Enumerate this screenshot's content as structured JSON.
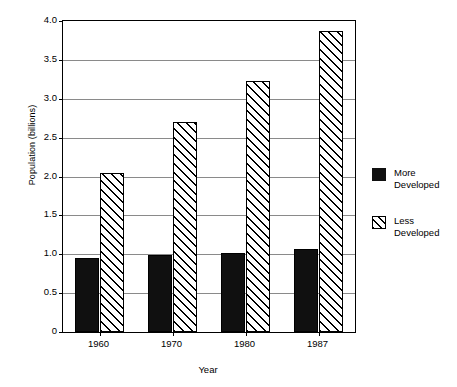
{
  "chart_data": {
    "type": "bar",
    "title": "",
    "xlabel": "Year",
    "ylabel": "Population (billions)",
    "categories": [
      "1960",
      "1970",
      "1980",
      "1987"
    ],
    "series": [
      {
        "name": "More Developed",
        "values": [
          0.95,
          0.99,
          1.02,
          1.07
        ],
        "style": "solid-black"
      },
      {
        "name": "Less Developed",
        "values": [
          2.05,
          2.7,
          3.23,
          3.87
        ],
        "style": "hatched-diagonal"
      }
    ],
    "ylim": [
      0,
      4.0
    ],
    "ytick_labels": [
      "0",
      "0.5",
      "1.0",
      "1.5",
      "2.0",
      "2.5",
      "3.0",
      "3.5",
      "4.0"
    ],
    "ytick_values": [
      0,
      0.5,
      1.0,
      1.5,
      2.0,
      2.5,
      3.0,
      3.5,
      4.0
    ],
    "grid": true,
    "grid_axis": "y",
    "legend_position": "right",
    "legend_entries": [
      {
        "label_line1": "More",
        "label_line2": "Developed"
      },
      {
        "label_line1": "Less",
        "label_line2": "Developed"
      }
    ],
    "colors": {
      "more_developed": "#101010",
      "less_developed_fill": "#ffffff",
      "less_developed_hatch": "#000000",
      "axis": "#000000",
      "grid": "#8a8a8a",
      "background": "#ffffff"
    }
  }
}
